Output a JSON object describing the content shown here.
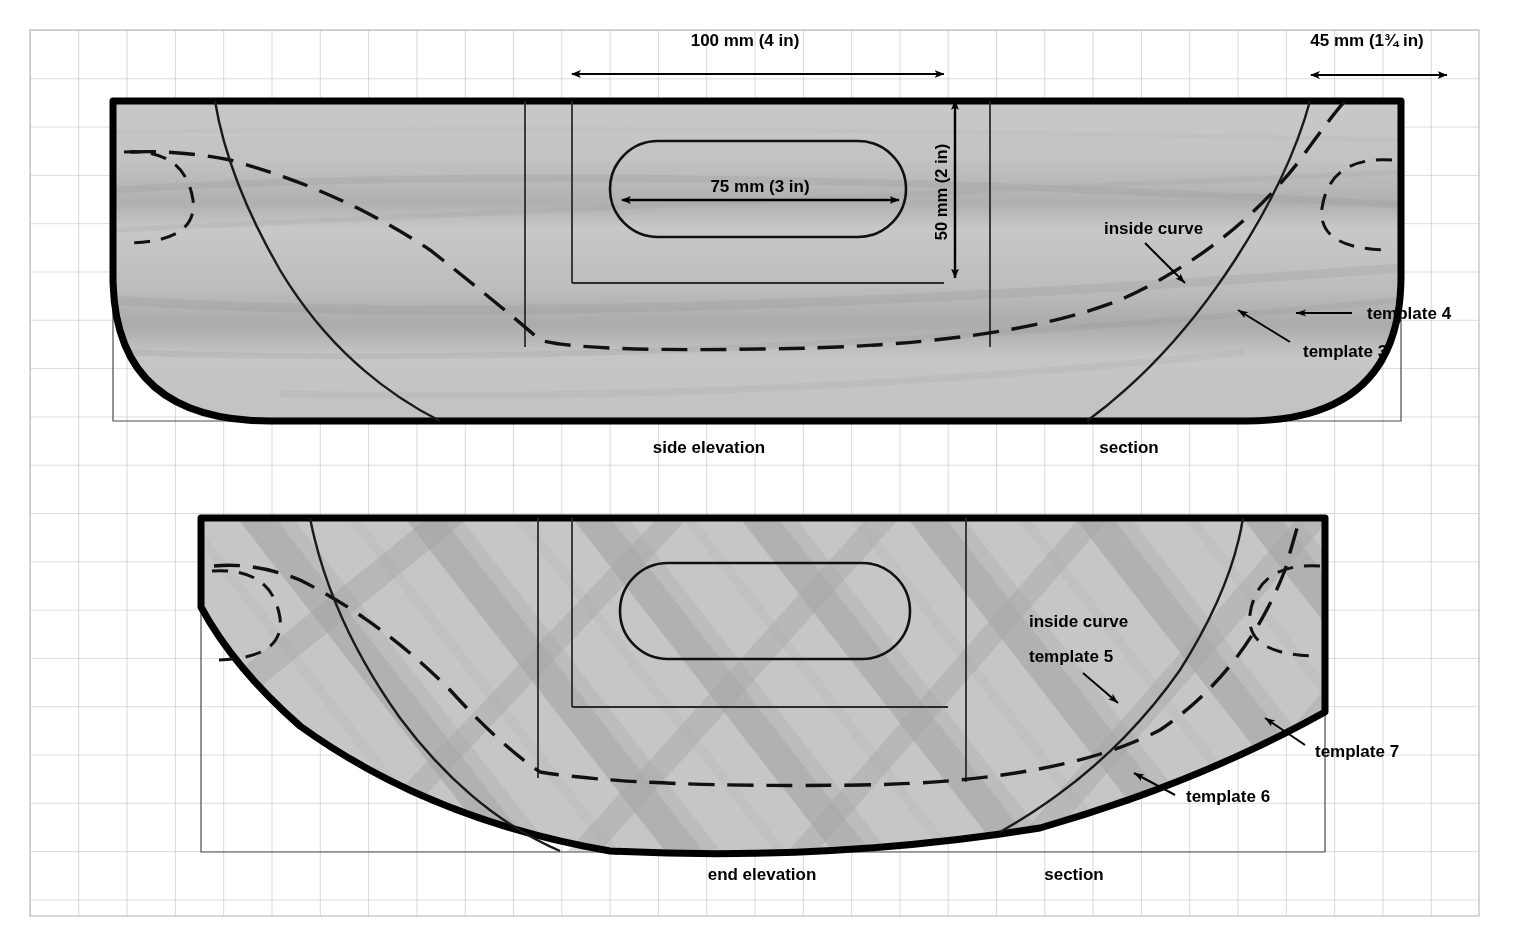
{
  "document": {
    "kind": "technical-drawing",
    "subject": "carved wooden bowl / tray template plan",
    "background_color": "#ffffff",
    "grid_color": "#b9b9b9",
    "wood_fill_color": "#c6c6c6",
    "outline_color": "#000000"
  },
  "grid": {
    "origin_x": 30,
    "origin_y": 30,
    "spacing": 48.3,
    "cols": 30,
    "rows": 19,
    "visible": true
  },
  "dimensions": [
    {
      "id": "length-100mm",
      "label": "100 mm (4 in)",
      "orientation": "horizontal",
      "x1": 572,
      "x2": 944,
      "y": 74,
      "text_x": 745,
      "text_y": 46
    },
    {
      "id": "width-45mm",
      "label": "45 mm (1¾ in)",
      "orientation": "horizontal",
      "x1": 1311,
      "x2": 1447,
      "y": 75,
      "text_x": 1367,
      "text_y": 46
    },
    {
      "id": "handle-75mm",
      "label": "75 mm (3 in)",
      "orientation": "horizontal",
      "x1": 622,
      "x2": 899,
      "y": 200,
      "text_x": 760,
      "text_y": 190
    },
    {
      "id": "depth-50mm",
      "label": "50 mm (2 in)",
      "orientation": "vertical",
      "x": 955,
      "y1": 101,
      "y2": 278,
      "text_x": 947,
      "text_y": 192
    }
  ],
  "views": [
    {
      "id": "upper",
      "caption_left": "side elevation",
      "caption_right": "section",
      "caption_left_x": 709,
      "caption_right_x": 1096,
      "caption_y": 453,
      "annotations": [
        {
          "id": "inside-curve-upper",
          "label": "inside curve",
          "x": 1104,
          "y": 234,
          "anchor": "start"
        },
        {
          "id": "template-4",
          "label": "template 4",
          "x": 1367,
          "y": 319,
          "anchor": "start"
        },
        {
          "id": "template-3",
          "label": "template 3",
          "x": 1303,
          "y": 357,
          "anchor": "start"
        }
      ]
    },
    {
      "id": "lower",
      "caption_left": "end elevation",
      "caption_right": "section",
      "caption_left_x": 707,
      "caption_right_x": 1042,
      "caption_y": 880,
      "annotations": [
        {
          "id": "inside-curve-lower",
          "label": "inside curve",
          "x": 1029,
          "y": 627,
          "anchor": "start"
        },
        {
          "id": "template-5",
          "label": "template 5",
          "x": 1029,
          "y": 662,
          "anchor": "start"
        },
        {
          "id": "template-7",
          "label": "template 7",
          "x": 1315,
          "y": 757,
          "anchor": "start"
        },
        {
          "id": "template-6",
          "label": "template 6",
          "x": 1186,
          "y": 802,
          "anchor": "start"
        }
      ]
    }
  ]
}
